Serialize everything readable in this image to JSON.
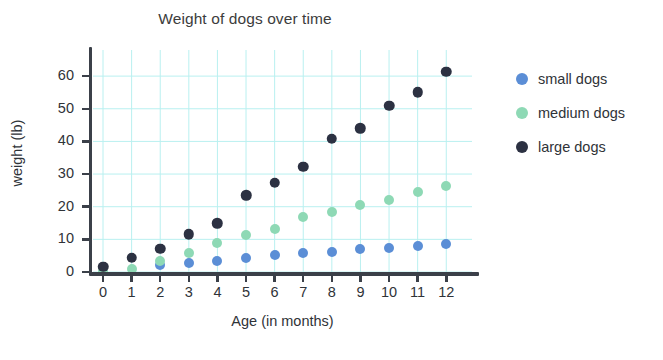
{
  "chart_data": {
    "type": "scatter",
    "title": "Weight of dogs over time",
    "xlabel": "Age (in months)",
    "ylabel": "weight (lb)",
    "x": [
      0,
      1,
      2,
      3,
      4,
      5,
      6,
      7,
      8,
      9,
      10,
      11,
      12
    ],
    "xlim": [
      -0.35,
      12.9
    ],
    "ylim": [
      0,
      68
    ],
    "xticks": [
      "0",
      "1",
      "2",
      "3",
      "4",
      "5",
      "6",
      "7",
      "8",
      "9",
      "10",
      "11",
      "12"
    ],
    "yticks": [
      "0",
      "10",
      "20",
      "30",
      "40",
      "50",
      "60"
    ],
    "ytick_values": [
      0,
      10,
      20,
      30,
      40,
      50,
      60
    ],
    "grid": true,
    "grid_color": "#b9f0f0",
    "legend_position": "right",
    "series": [
      {
        "name": "small dogs",
        "color": "#5b8ed6",
        "values": [
          null,
          null,
          2.0,
          2.8,
          3.3,
          4.2,
          5.2,
          5.9,
          6.2,
          7.0,
          7.4,
          7.9,
          8.5
        ]
      },
      {
        "name": "medium dogs",
        "color": "#8ed9b5",
        "values": [
          0.3,
          1.0,
          3.5,
          5.8,
          8.8,
          11.4,
          13.2,
          16.9,
          18.4,
          20.4,
          22.0,
          24.6,
          26.3
        ]
      },
      {
        "name": "large dogs",
        "color": "#2c3142",
        "values": [
          1.6,
          4.4,
          7.1,
          11.5,
          15.0,
          23.5,
          27.4,
          32.2,
          40.8,
          44.0,
          51.0,
          55.0,
          61.3
        ]
      }
    ]
  },
  "legend": {
    "items": [
      {
        "label": "small dogs",
        "color": "#5b8ed6"
      },
      {
        "label": "medium dogs",
        "color": "#8ed9b5"
      },
      {
        "label": "large dogs",
        "color": "#2c3142"
      }
    ]
  }
}
